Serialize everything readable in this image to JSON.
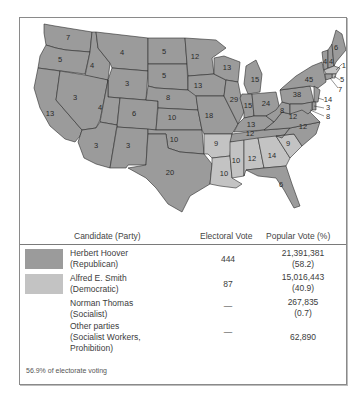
{
  "map": {
    "title": "1928 Presidential Election",
    "colors": {
      "republican": "#9b9b9b",
      "democratic": "#c3c3c3"
    },
    "state_labels": [
      {
        "id": "WA",
        "votes": "7",
        "party": "R"
      },
      {
        "id": "OR",
        "votes": "5",
        "party": "R"
      },
      {
        "id": "CA",
        "votes": "13",
        "party": "R"
      },
      {
        "id": "ID",
        "votes": "4",
        "party": "R"
      },
      {
        "id": "NV",
        "votes": "3",
        "party": "R"
      },
      {
        "id": "MT",
        "votes": "4",
        "party": "R"
      },
      {
        "id": "WY",
        "votes": "3",
        "party": "R"
      },
      {
        "id": "UT",
        "votes": "4",
        "party": "R"
      },
      {
        "id": "CO",
        "votes": "6",
        "party": "R"
      },
      {
        "id": "AZ",
        "votes": "3",
        "party": "R"
      },
      {
        "id": "NM",
        "votes": "3",
        "party": "R"
      },
      {
        "id": "ND",
        "votes": "5",
        "party": "R"
      },
      {
        "id": "SD",
        "votes": "5",
        "party": "R"
      },
      {
        "id": "NE",
        "votes": "8",
        "party": "R"
      },
      {
        "id": "KS",
        "votes": "10",
        "party": "R"
      },
      {
        "id": "OK",
        "votes": "10",
        "party": "R"
      },
      {
        "id": "TX",
        "votes": "20",
        "party": "R"
      },
      {
        "id": "MN",
        "votes": "12",
        "party": "R"
      },
      {
        "id": "IA",
        "votes": "13",
        "party": "R"
      },
      {
        "id": "MO",
        "votes": "18",
        "party": "R"
      },
      {
        "id": "AR",
        "votes": "9",
        "party": "D"
      },
      {
        "id": "LA",
        "votes": "10",
        "party": "D"
      },
      {
        "id": "WI",
        "votes": "13",
        "party": "R"
      },
      {
        "id": "IL",
        "votes": "29",
        "party": "R"
      },
      {
        "id": "MI",
        "votes": "15",
        "party": "R"
      },
      {
        "id": "IN",
        "votes": "15",
        "party": "R"
      },
      {
        "id": "OH",
        "votes": "24",
        "party": "R"
      },
      {
        "id": "KY",
        "votes": "13",
        "party": "R"
      },
      {
        "id": "TN",
        "votes": "12",
        "party": "R"
      },
      {
        "id": "MS",
        "votes": "10",
        "party": "D"
      },
      {
        "id": "AL",
        "votes": "12",
        "party": "D"
      },
      {
        "id": "GA",
        "votes": "14",
        "party": "D"
      },
      {
        "id": "FL",
        "votes": "6",
        "party": "R"
      },
      {
        "id": "SC",
        "votes": "9",
        "party": "D"
      },
      {
        "id": "NC",
        "votes": "12",
        "party": "R"
      },
      {
        "id": "VA",
        "votes": "12",
        "party": "R"
      },
      {
        "id": "WV",
        "votes": "8",
        "party": "R"
      },
      {
        "id": "PA",
        "votes": "38",
        "party": "R"
      },
      {
        "id": "NY",
        "votes": "45",
        "party": "R"
      },
      {
        "id": "VT",
        "votes": "4",
        "party": "R"
      },
      {
        "id": "NH",
        "votes": "4",
        "party": "R"
      },
      {
        "id": "ME",
        "votes": "6",
        "party": "R"
      },
      {
        "id": "MA",
        "votes": "18",
        "party": "D"
      },
      {
        "id": "RI",
        "votes": "5",
        "party": "D"
      },
      {
        "id": "CT",
        "votes": "7",
        "party": "R"
      },
      {
        "id": "NJ",
        "votes": "14",
        "party": "R"
      },
      {
        "id": "DE",
        "votes": "3",
        "party": "R"
      },
      {
        "id": "MD",
        "votes": "8",
        "party": "R"
      }
    ]
  },
  "legend": {
    "headers": {
      "candidate": "Candidate (Party)",
      "electoral": "Electoral Vote",
      "popular": "Popular Vote (%)"
    },
    "rows": [
      {
        "name": "Herbert Hoover",
        "party": "(Republican)",
        "electoral": "444",
        "popular": "21,391,381",
        "percent": "(58.2)",
        "swatch": "#9b9b9b"
      },
      {
        "name": "Alfred E. Smith",
        "party": "(Democratic)",
        "electoral": "87",
        "popular": "15,016,443",
        "percent": "(40.9)",
        "swatch": "#c3c3c3"
      },
      {
        "name": "Norman Thomas",
        "party": "(Socialist)",
        "electoral": "—",
        "popular": "267,835",
        "percent": "(0.7)"
      },
      {
        "name": "Other parties",
        "party": "(Socialist Workers,",
        "party2": "Prohibition)",
        "electoral": "—",
        "popular": "62,890"
      }
    ],
    "footnote": "56.9% of electorate voting"
  }
}
